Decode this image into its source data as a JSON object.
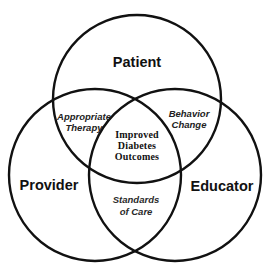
{
  "diagram": {
    "type": "venn",
    "circles": [
      {
        "id": "patient",
        "label": "Patient",
        "cx": 137,
        "cy": 99,
        "r": 84
      },
      {
        "id": "provider",
        "label": "Provider",
        "cx": 95,
        "cy": 175,
        "r": 86
      },
      {
        "id": "educator",
        "label": "Educator",
        "cx": 175,
        "cy": 175,
        "r": 86
      }
    ],
    "labels": {
      "patient": "Patient",
      "provider": "Provider",
      "educator": "Educator"
    },
    "overlaps": {
      "patient_provider": {
        "line1": "Appropriate",
        "line2": "Therapy"
      },
      "patient_educator": {
        "line1": "Behavior",
        "line2": "Change"
      },
      "provider_educator": {
        "line1": "Standards",
        "line2": "of Care"
      },
      "center": {
        "line1": "Improved",
        "line2": "Diabetes",
        "line3": "Outcomes"
      }
    },
    "colors": {
      "stroke": "#111111",
      "text": "#111111",
      "background": "#ffffff"
    }
  }
}
